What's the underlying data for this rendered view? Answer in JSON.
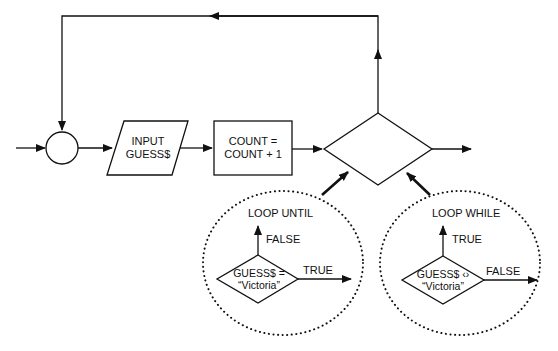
{
  "diagram": {
    "main_flow": {
      "connector": "circle",
      "input_box": {
        "line1": "INPUT",
        "line2": "GUESS$"
      },
      "process_box": {
        "line1": "COUNT =",
        "line2": "COUNT + 1"
      },
      "decision": "diamond"
    },
    "loop_until": {
      "title": "LOOP UNTIL",
      "condition_line1": "GUESS$ =",
      "condition_line2": "“Victoria”",
      "up_label": "FALSE",
      "right_label": "TRUE"
    },
    "loop_while": {
      "title": "LOOP WHILE",
      "condition_line1": "GUESS$ ‹›",
      "condition_line2": "“Victoria”",
      "up_label": "TRUE",
      "right_label": "FALSE"
    }
  }
}
